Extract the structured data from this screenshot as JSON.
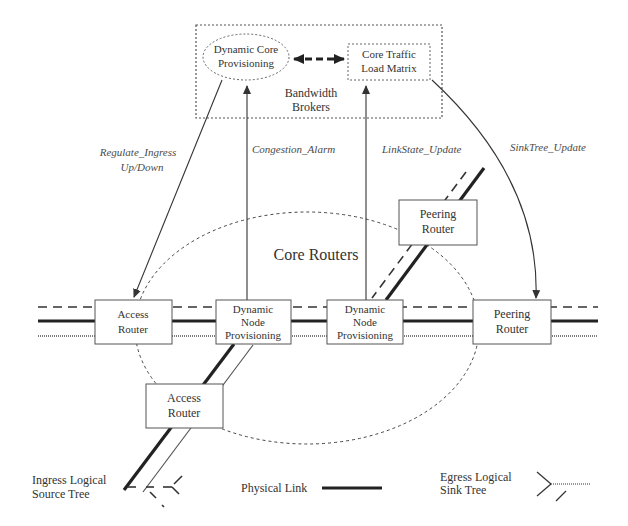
{
  "diagram": {
    "type": "network-architecture",
    "broker_group": {
      "label_line1": "Bandwidth",
      "label_line2": "Brokers",
      "dynamic_core": {
        "line1": "Dynamic Core",
        "line2": "Provisioning"
      },
      "traffic_matrix": {
        "line1": "Core Traffic",
        "line2": "Load Matrix"
      }
    },
    "core_region": {
      "label": "Core Routers"
    },
    "nodes": {
      "access_router_left": {
        "line1": "Access",
        "line2": "Router"
      },
      "dnp_left": {
        "line1": "Dynamic",
        "line2": "Node",
        "line3": "Provisioning"
      },
      "dnp_right": {
        "line1": "Dynamic",
        "line2": "Node",
        "line3": "Provisioning"
      },
      "peering_router_right": {
        "line1": "Peering",
        "line2": "Router"
      },
      "peering_router_top": {
        "line1": "Peering",
        "line2": "Router"
      },
      "access_router_bottom": {
        "line1": "Access",
        "line2": "Router"
      }
    },
    "messages": {
      "regulate_line1": "Regulate_Ingress",
      "regulate_line2": "Up/Down",
      "congestion": "Congestion_Alarm",
      "linkstate": "LinkState_Update",
      "sinktree": "SinkTree_Update"
    },
    "legend": {
      "ingress_line1": "Ingress Logical",
      "ingress_line2": "Source Tree",
      "physical": "Physical Link",
      "egress_line1": "Egress Logical",
      "egress_line2": "Sink Tree"
    },
    "colors": {
      "stroke": "#555555",
      "thick_link": "#222222",
      "text": "#333333"
    }
  }
}
